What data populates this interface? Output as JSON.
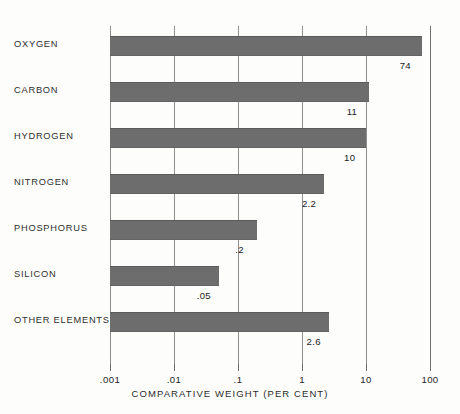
{
  "chart_data": {
    "type": "bar",
    "orientation": "horizontal",
    "title": "",
    "xlabel": "COMPARATIVE WEIGHT (PER CENT)",
    "ylabel": "",
    "xscale": "log",
    "xlim": [
      0.001,
      100
    ],
    "grid": true,
    "legend": false,
    "categories": [
      "OXYGEN",
      "CARBON",
      "HYDROGEN",
      "NITROGEN",
      "PHOSPHORUS",
      "SILICON",
      "OTHER ELEMENTS"
    ],
    "values": [
      74,
      11,
      10,
      2.2,
      0.2,
      0.05,
      2.6
    ],
    "value_labels": [
      "74",
      "11",
      "10",
      "2.2",
      ".2",
      ".05",
      "2.6"
    ],
    "xticks": [
      0.001,
      0.01,
      0.1,
      1,
      10,
      100
    ],
    "xtick_labels": [
      ".001",
      ".01",
      ".1",
      "1",
      "10",
      "100"
    ],
    "bar_color": "#6d6d6d",
    "grid_color": "#8e8e8e",
    "text_color": "#1f1f1f"
  }
}
